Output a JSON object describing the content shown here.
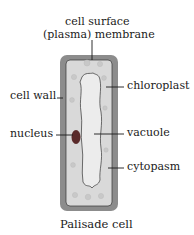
{
  "diagram": {
    "title": "Palisade cell",
    "labels": {
      "membrane_line1": "cell surface",
      "membrane_line2": "(plasma) membrane",
      "cell_wall": "cell wall",
      "chloroplast": "chloroplast",
      "nucleus": "nucleus",
      "vacuole": "vacuole",
      "cytoplasm": "cytopasm"
    },
    "colors": {
      "cell_wall": "#8c8c8c",
      "cytoplasm": "#d9d9d9",
      "vacuole": "#ececec",
      "chloroplast": "#c8c8c8",
      "nucleus": "#5a2a2a",
      "outline": "#333333",
      "leader_line": "#1a1a1a"
    }
  }
}
